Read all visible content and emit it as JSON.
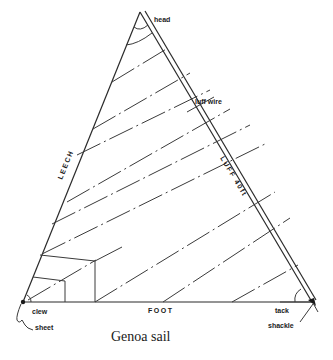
{
  "diagram": {
    "title": "Genoa sail",
    "labels": {
      "head": "head",
      "luff_wire": "luff wire",
      "leech": "LEECH",
      "luff": "LUFF 40ft",
      "foot": "FOOT",
      "clew": "clew",
      "sheet": "sheet",
      "tack": "tack",
      "shackle": "shackle"
    },
    "corners": {
      "head": [
        140,
        12
      ],
      "clew": [
        23,
        302
      ],
      "tack": [
        312,
        302
      ]
    },
    "colors": {
      "line": "#2a2a2a",
      "background": "#ffffff"
    }
  }
}
